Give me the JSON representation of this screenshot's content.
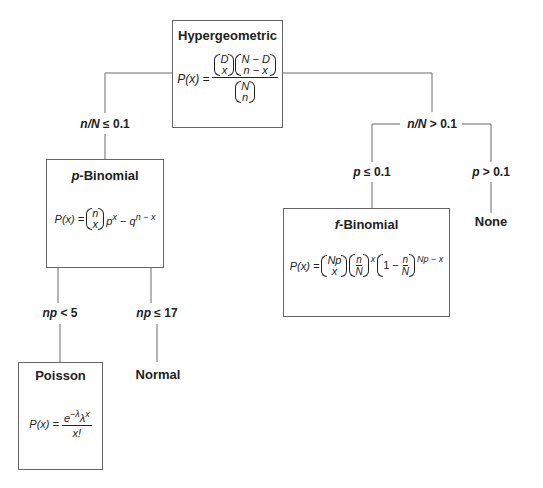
{
  "diagram": {
    "nodes": {
      "hypergeometric": {
        "title": "Hypergeometric",
        "formula": "P(x) = C(D,x)·C(N−D,n−x) / C(N,n)",
        "lhs": "P(x) =",
        "binom1_top": "D",
        "binom1_bottom": "x",
        "binom2_top": "N − D",
        "binom2_bottom": "n − x",
        "binom3_top": "N",
        "binom3_bottom": "n"
      },
      "p_binomial": {
        "title_prefix": "p",
        "title_suffix": "-Binomial",
        "formula": "P(x) = C(n,x) p^x − q^(n−x)",
        "lhs": "P(x) =",
        "binom_top": "n",
        "binom_bottom": "x",
        "term1_base": "p",
        "term1_exp": "x",
        "op": " − ",
        "term2_base": "q",
        "term2_exp": "n − x"
      },
      "f_binomial": {
        "title_prefix": "f",
        "title_suffix": "-Binomial",
        "formula": "P(x) = C(Np,x) (n/N)^x (1 − n/N)^(Np−x)",
        "lhs": "P(x) =",
        "binom_top": "Np",
        "binom_bottom": "x",
        "frac_num": "n",
        "frac_den": "N",
        "exp1": "x",
        "one_minus": "1 −",
        "exp2": "Np − x"
      },
      "poisson": {
        "title": "Poisson",
        "formula": "P(x) = e^(−λ) λ^x / x!",
        "lhs": "P(x) =",
        "num_base": "e",
        "num_exp": "−λ",
        "num_lambda": "λ",
        "num_lambda_exp": "x",
        "den": "x!"
      },
      "normal": {
        "title": "Normal"
      },
      "none": {
        "title": "None"
      }
    },
    "edges": {
      "left_condition": {
        "var": "n/N",
        "op": " ≤ 0.1"
      },
      "right_condition": {
        "var": "n/N",
        "op": " > 0.1"
      },
      "p_le": {
        "var": "p",
        "op": " ≤ 0.1"
      },
      "p_gt": {
        "var": "p",
        "op": " > 0.1"
      },
      "np_lt": {
        "var": "np",
        "op": " < 5"
      },
      "np_le": {
        "var": "np",
        "op": " ≤ 17"
      }
    },
    "colors": {
      "line": "#6b6b6b",
      "text": "#222222",
      "box_border": "#666666"
    }
  }
}
